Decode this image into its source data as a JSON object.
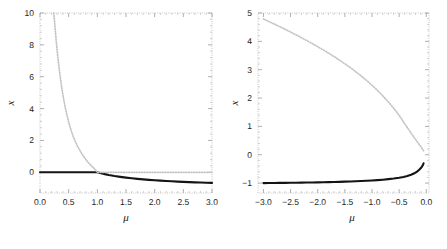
{
  "figure": {
    "background_color": "#ffffff",
    "panel_count": 2
  },
  "chart_data": [
    {
      "type": "line",
      "panel": "left",
      "title": "",
      "xlabel": "μ",
      "ylabel": "x",
      "xlim": [
        0.0,
        3.0
      ],
      "ylim": [
        -1.3,
        10.0
      ],
      "grid": false,
      "legend": "none",
      "xticks": [
        0.0,
        0.5,
        1.0,
        1.5,
        2.0,
        2.5,
        3.0
      ],
      "xticklabels": [
        "0.0",
        "0.5",
        "1.0",
        "1.5",
        "2.0",
        "2.5",
        "3.0"
      ],
      "yticks": [
        0,
        2,
        4,
        6,
        8,
        10
      ],
      "yticklabels": [
        "0",
        "2",
        "4",
        "6",
        "8",
        "10"
      ],
      "series": [
        {
          "name": "stable-branch",
          "style": "solid",
          "color": "#141414",
          "x": [
            0.0,
            0.1,
            0.2,
            0.3,
            0.4,
            0.5,
            0.6,
            0.7,
            0.8,
            0.9,
            1.0,
            1.05,
            1.1,
            1.15,
            1.2,
            1.3,
            1.4,
            1.5,
            1.6,
            1.7,
            1.8,
            1.9,
            2.0,
            2.1,
            2.2,
            2.3,
            2.4,
            2.5,
            2.6,
            2.7,
            2.8,
            2.9,
            3.0
          ],
          "y": [
            0.0,
            0.0,
            0.0,
            0.0,
            0.0,
            0.0,
            0.0,
            0.0,
            0.0,
            0.0,
            0.0,
            -0.048,
            -0.091,
            -0.13,
            -0.167,
            -0.231,
            -0.286,
            -0.333,
            -0.375,
            -0.412,
            -0.444,
            -0.474,
            -0.5,
            -0.524,
            -0.545,
            -0.565,
            -0.583,
            -0.6,
            -0.615,
            -0.63,
            -0.643,
            -0.655,
            -0.667
          ]
        },
        {
          "name": "unstable-branch",
          "style": "dotted",
          "color": "#c4c4c4",
          "x": [
            0.24,
            0.25,
            0.26,
            0.28,
            0.3,
            0.32,
            0.34,
            0.36,
            0.38,
            0.4,
            0.43,
            0.46,
            0.5,
            0.54,
            0.58,
            0.62,
            0.66,
            0.7,
            0.75,
            0.8,
            0.85,
            0.9,
            0.95,
            1.0,
            1.1,
            1.2,
            1.4,
            1.6,
            1.8,
            2.0,
            2.2,
            2.4,
            2.6,
            2.8,
            3.0
          ],
          "y": [
            10.0,
            9.6,
            9.2,
            8.35,
            7.6,
            6.95,
            6.35,
            5.8,
            5.3,
            4.85,
            4.25,
            3.75,
            3.15,
            2.65,
            2.25,
            1.9,
            1.6,
            1.35,
            1.05,
            0.8,
            0.58,
            0.4,
            0.22,
            0.0,
            0.0,
            0.0,
            0.0,
            0.0,
            0.0,
            0.0,
            0.0,
            0.0,
            0.0,
            0.0,
            0.0
          ]
        }
      ]
    },
    {
      "type": "line",
      "panel": "right",
      "title": "",
      "xlabel": "μ",
      "ylabel": "x",
      "xlim": [
        -3.1,
        0.05
      ],
      "ylim": [
        -1.35,
        5.0
      ],
      "grid": false,
      "legend": "none",
      "xticks": [
        -3.0,
        -2.5,
        -2.0,
        -1.5,
        -1.0,
        -0.5,
        0.0
      ],
      "xticklabels": [
        "-3.0",
        "-2.5",
        "-2.0",
        "-1.5",
        "-1.0",
        "-0.5",
        "0.0"
      ],
      "yticks": [
        -1,
        0,
        1,
        2,
        3,
        4,
        5
      ],
      "yticklabels": [
        "-1",
        "0",
        "1",
        "2",
        "3",
        "4",
        "5"
      ],
      "series": [
        {
          "name": "stable-branch",
          "style": "solid",
          "color": "#141414",
          "x": [
            -3.0,
            -2.9,
            -2.8,
            -2.7,
            -2.6,
            -2.5,
            -2.4,
            -2.3,
            -2.2,
            -2.1,
            -2.0,
            -1.9,
            -1.8,
            -1.7,
            -1.6,
            -1.5,
            -1.4,
            -1.3,
            -1.2,
            -1.1,
            -1.0,
            -0.9,
            -0.8,
            -0.7,
            -0.6,
            -0.5,
            -0.42,
            -0.35,
            -0.28,
            -0.22,
            -0.17,
            -0.13,
            -0.1,
            -0.08,
            -0.06,
            -0.05
          ],
          "y": [
            -1.0,
            -0.998,
            -0.996,
            -0.994,
            -0.992,
            -0.99,
            -0.987,
            -0.984,
            -0.981,
            -0.978,
            -0.974,
            -0.97,
            -0.966,
            -0.961,
            -0.956,
            -0.95,
            -0.943,
            -0.936,
            -0.928,
            -0.918,
            -0.908,
            -0.895,
            -0.88,
            -0.862,
            -0.84,
            -0.812,
            -0.783,
            -0.75,
            -0.706,
            -0.655,
            -0.595,
            -0.53,
            -0.47,
            -0.418,
            -0.355,
            -0.3
          ]
        },
        {
          "name": "unstable-branch",
          "style": "dotted",
          "color": "#c4c4c4",
          "x": [
            -3.0,
            -2.9,
            -2.8,
            -2.7,
            -2.6,
            -2.5,
            -2.4,
            -2.3,
            -2.2,
            -2.1,
            -2.0,
            -1.9,
            -1.8,
            -1.7,
            -1.6,
            -1.5,
            -1.4,
            -1.3,
            -1.2,
            -1.1,
            -1.0,
            -0.9,
            -0.8,
            -0.7,
            -0.6,
            -0.5,
            -0.42,
            -0.35,
            -0.28,
            -0.22,
            -0.17,
            -0.13,
            -0.1,
            -0.08,
            -0.06,
            -0.05
          ],
          "y": [
            4.79,
            4.7,
            4.61,
            4.52,
            4.425,
            4.33,
            4.23,
            4.13,
            4.025,
            3.92,
            3.81,
            3.7,
            3.585,
            3.465,
            3.34,
            3.21,
            3.075,
            2.93,
            2.78,
            2.62,
            2.45,
            2.27,
            2.075,
            1.865,
            1.64,
            1.39,
            1.16,
            0.96,
            0.76,
            0.6,
            0.465,
            0.36,
            0.285,
            0.23,
            0.175,
            0.14
          ]
        }
      ]
    }
  ],
  "panels": {
    "left": {
      "name": "left-panel",
      "xlabel": "μ",
      "ylabel": "x",
      "xticklabels": [
        "0.0",
        "0.5",
        "1.0",
        "1.5",
        "2.0",
        "2.5",
        "3.0"
      ],
      "yticklabels": [
        "0",
        "2",
        "4",
        "6",
        "8",
        "10"
      ]
    },
    "right": {
      "name": "right-panel",
      "xlabel": "μ",
      "ylabel": "x",
      "xticklabels": [
        "-3.0",
        "-2.5",
        "-2.0",
        "-1.5",
        "-1.0",
        "-0.5",
        "0.0"
      ],
      "yticklabels": [
        "-1",
        "0",
        "1",
        "2",
        "3",
        "4",
        "5"
      ]
    }
  },
  "colors": {
    "stable_curve": "#141414",
    "unstable_curve": "#c4c4c4",
    "frame": "#b9b9b9",
    "text": "#1a1a1a",
    "background": "#ffffff"
  }
}
